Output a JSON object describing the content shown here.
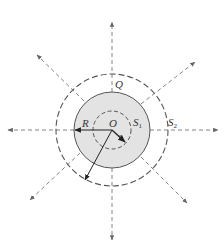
{
  "diagram": {
    "labels": {
      "charge": "Q",
      "center": "O",
      "big_radius": "R",
      "small_radius": "r",
      "surface1_main": "S",
      "surface1_sub": "1",
      "surface2_main": "S",
      "surface2_sub": "2"
    },
    "colors": {
      "shaded_sphere": "#e3e3e3",
      "line": "#555555",
      "dashed": "#666666",
      "background": "#ffffff"
    },
    "geometry": {
      "center": [
        112,
        130
      ],
      "sphere_radius": 38,
      "surface1_radius": 19,
      "surface2_radius": 56
    }
  }
}
